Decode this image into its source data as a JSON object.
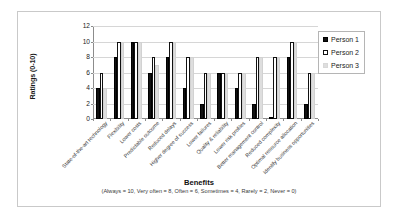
{
  "chart_data": {
    "type": "bar",
    "title": "",
    "xlabel": "Benefits",
    "xlabel_note": "(Always = 10, Very often = 8, Often  = 6, Sometimes = 4, Rarely = 2, Never = 0)",
    "ylabel": "Ratings (0-10)",
    "ylim": [
      0,
      12
    ],
    "yticks": [
      0,
      2,
      4,
      6,
      8,
      10,
      12
    ],
    "ytick_labels": [
      "0",
      "2",
      "4",
      "6",
      "8",
      "10",
      "12"
    ],
    "grid": true,
    "legend_position": "right",
    "categories": [
      "State-of-the-art technology",
      "Flexibility",
      "Lower costs",
      "Predictable outcome",
      "Reduced delays",
      "Higher degree of success",
      "Lower failures",
      "Quality & reliability",
      "Lower risk profiles",
      "Better management control",
      "Reduced complexity",
      "Optimal resource allocation",
      "Identify business opportunities"
    ],
    "series": [
      {
        "name": "Person 1",
        "color": "#111111",
        "values": [
          4,
          8,
          10,
          6,
          8,
          4,
          2,
          6,
          4,
          2,
          0,
          8,
          2
        ]
      },
      {
        "name": "Person 2",
        "color": "#ffffff",
        "values": [
          6,
          10,
          10,
          8,
          10,
          8,
          6,
          6,
          6,
          8,
          8,
          10,
          6
        ]
      },
      {
        "name": "Person 3",
        "color": "#dedede",
        "values": [
          4,
          10,
          10,
          7,
          10,
          8,
          6,
          6,
          6,
          8,
          8,
          10,
          6
        ]
      }
    ]
  },
  "legend": {
    "items": [
      {
        "label": "Person 1"
      },
      {
        "label": "Person 2"
      },
      {
        "label": "Person 3"
      }
    ]
  }
}
